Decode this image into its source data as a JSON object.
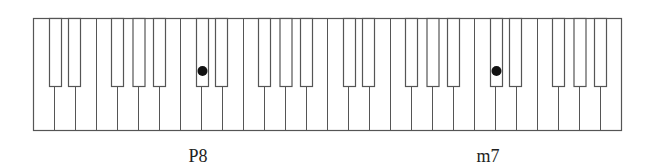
{
  "diagram": {
    "type": "piano-keyboard-intervals",
    "keyboard": {
      "octaves": 4,
      "start_note": "C",
      "end_note": "B",
      "white_keys_per_octave": [
        "C",
        "D",
        "E",
        "F",
        "G",
        "A",
        "B"
      ],
      "black_keys_per_octave": [
        "C#",
        "D#",
        "F#",
        "G#",
        "A#"
      ],
      "total_white_keys": 28,
      "total_black_keys": 20
    },
    "markers": [
      {
        "octave": 2,
        "note": "C#",
        "label": "P8"
      },
      {
        "octave": 4,
        "note": "C#",
        "label": "m7"
      }
    ],
    "labels": {
      "left": "P8",
      "right": "m7"
    },
    "colors": {
      "outline": "#555555",
      "key_fill": "#ffffff",
      "marker": "#111111",
      "text": "#222222",
      "background": "#ffffff"
    }
  }
}
